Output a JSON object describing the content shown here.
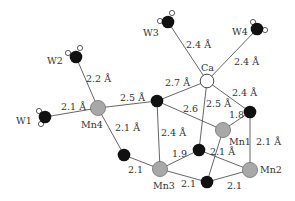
{
  "colors": {
    "bond": "#555555",
    "oxygen": "#111111",
    "manganese": "#a8a8a8",
    "calcium": "#ffffff",
    "hydrogen": "#ffffff",
    "outline": "#333333",
    "text": "#333333"
  },
  "atoms": {
    "W1": {
      "label": "W1",
      "x": 45,
      "y": 117,
      "type": "water"
    },
    "W2": {
      "label": "W2",
      "x": 76,
      "y": 57,
      "type": "water"
    },
    "W3": {
      "label": "W3",
      "x": 168,
      "y": 22,
      "type": "water"
    },
    "W4": {
      "label": "W4",
      "x": 257,
      "y": 29,
      "type": "water"
    },
    "Ca": {
      "label": "Ca",
      "x": 207,
      "y": 81,
      "type": "calcium"
    },
    "Mn1": {
      "label": "Mn1",
      "x": 223,
      "y": 130,
      "type": "manganese"
    },
    "Mn2": {
      "label": "Mn2",
      "x": 250,
      "y": 170,
      "type": "manganese"
    },
    "Mn3": {
      "label": "Mn3",
      "x": 160,
      "y": 169,
      "type": "manganese"
    },
    "Mn4": {
      "label": "Mn4",
      "x": 98,
      "y": 108,
      "type": "manganese"
    },
    "O1": {
      "x": 157,
      "y": 101,
      "type": "oxygen"
    },
    "O2": {
      "x": 124,
      "y": 155,
      "type": "oxygen"
    },
    "O3": {
      "x": 199,
      "y": 150,
      "type": "oxygen"
    },
    "O4": {
      "x": 250,
      "y": 112,
      "type": "oxygen"
    },
    "O5": {
      "x": 207,
      "y": 182,
      "type": "oxygen"
    }
  },
  "bonds": [
    {
      "from": "W1",
      "to": "Mn4",
      "length": "2.1 Å"
    },
    {
      "from": "W2",
      "to": "Mn4",
      "length": "2.2 Å"
    },
    {
      "from": "W3",
      "to": "Ca",
      "length": "2.4 Å"
    },
    {
      "from": "W4",
      "to": "Ca",
      "length": "2.4 Å"
    },
    {
      "from": "Mn4",
      "to": "O1",
      "length": "2.5 Å"
    },
    {
      "from": "O1",
      "to": "Ca",
      "length": "2.7 Å"
    },
    {
      "from": "Ca",
      "to": "O4",
      "length": "2.4 Å"
    },
    {
      "from": "Ca",
      "to": "O3",
      "length": "2.5 Å"
    },
    {
      "from": "O1",
      "to": "Mn1",
      "length": "2.6"
    },
    {
      "from": "O1",
      "to": "Mn3",
      "length": "2.4 Å"
    },
    {
      "from": "Mn4",
      "to": "O2",
      "length": "2.1 Å"
    },
    {
      "from": "O2",
      "to": "Mn3",
      "length": "2.1"
    },
    {
      "from": "Mn3",
      "to": "O3",
      "length": "1.9"
    },
    {
      "from": "O4",
      "to": "Mn1",
      "length": "1.8"
    },
    {
      "from": "O4",
      "to": "Mn2",
      "length": "2.1 Å"
    },
    {
      "from": "Mn1",
      "to": "O5",
      "length": "2.1 Å"
    },
    {
      "from": "O3",
      "to": "Mn2",
      "length": ""
    },
    {
      "from": "Mn3",
      "to": "O5",
      "length": "2.1"
    },
    {
      "from": "O5",
      "to": "Mn2",
      "length": "2.1"
    }
  ],
  "labels": {
    "W1": "W1",
    "W2": "W2",
    "W3": "W3",
    "W4": "W4",
    "Ca": "Ca",
    "Mn1": "Mn1",
    "Mn2": "Mn2",
    "Mn3": "Mn3",
    "Mn4": "Mn4",
    "d_W1_Mn4": "2.1 Å",
    "d_W2_Mn4": "2.2 Å",
    "d_W3_Ca": "2.4 Å",
    "d_W4_Ca": "2.4 Å",
    "d_Mn4_O1": "2.5 Å",
    "d_O1_Ca": "2.7 Å",
    "d_Ca_O4": "2.4 Å",
    "d_Ca_O3": "2.5 Å",
    "d_O1_Mn1": "2.6",
    "d_O1_Mn3": "2.4 Å",
    "d_Mn4_O2": "2.1 Å",
    "d_O2_Mn3": "2.1",
    "d_Mn3_O3": "1.9",
    "d_O4_Mn1": "1.8",
    "d_O4_Mn2": "2.1 Å",
    "d_Mn1_O5": "2.1 Å",
    "d_Mn3_O5": "2.1",
    "d_O5_Mn2": "2.1"
  }
}
